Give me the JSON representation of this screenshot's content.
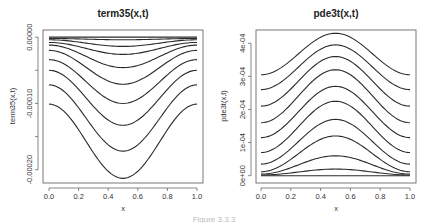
{
  "caption": "Figure 3.3.3",
  "chart_data": [
    {
      "type": "line",
      "title": "term35(x,t)",
      "xlabel": "x",
      "ylabel": "term35(x,t)",
      "xlim": [
        0,
        1
      ],
      "ylim": [
        -0.00022,
        1e-05
      ],
      "x_ticks": [
        "0.0",
        "0.2",
        "0.4",
        "0.6",
        "0.8",
        "1.0"
      ],
      "y_ticks": [
        "0.00000",
        "",
        "-0.00010",
        "",
        "-0.00020"
      ],
      "y_tick_values": [
        0.0,
        -5e-05,
        -0.0001,
        -0.00015,
        -0.0002
      ],
      "grid": false,
      "legend": null,
      "shape": "symmetric trough centered at x=0.5",
      "series": [
        {
          "name": "t1",
          "edge": 0.0,
          "extreme": 0.0
        },
        {
          "name": "t2",
          "edge": -2e-06,
          "extreme": -4e-06
        },
        {
          "name": "t3",
          "edge": -4e-06,
          "extreme": -1.4e-05
        },
        {
          "name": "t4",
          "edge": -8e-06,
          "extreme": -2.6e-05
        },
        {
          "name": "t5",
          "edge": -1.2e-05,
          "extreme": -4.6e-05
        },
        {
          "name": "t6",
          "edge": -2e-05,
          "extreme": -7.1e-05
        },
        {
          "name": "t7",
          "edge": -3.4e-05,
          "extreme": -0.0001
        },
        {
          "name": "t8",
          "edge": -5e-05,
          "extreme": -0.000133
        },
        {
          "name": "t9",
          "edge": -7.2e-05,
          "extreme": -0.000172
        },
        {
          "name": "t10",
          "edge": -0.000101,
          "extreme": -0.000213
        }
      ]
    },
    {
      "type": "line",
      "title": "pde3t(x,t)",
      "xlabel": "x",
      "ylabel": "pde3t(x,t)",
      "xlim": [
        0,
        1
      ],
      "ylim": [
        -1e-05,
        0.00044
      ],
      "x_ticks": [
        "0.0",
        "0.2",
        "0.4",
        "0.6",
        "0.8",
        "1.0"
      ],
      "y_ticks": [
        "0e+00",
        "1e-04",
        "2e-04",
        "3e-04",
        "4e-04"
      ],
      "y_tick_values": [
        0.0,
        0.0001,
        0.0002,
        0.0003,
        0.0004
      ],
      "grid": false,
      "legend": null,
      "shape": "symmetric bump centered at x=0.5",
      "series": [
        {
          "name": "t1",
          "edge": 0.0,
          "extreme": 0.0
        },
        {
          "name": "t2",
          "edge": 2e-06,
          "extreme": 2e-05
        },
        {
          "name": "t3",
          "edge": 5e-06,
          "extreme": 6e-05
        },
        {
          "name": "t4",
          "edge": 1.2e-05,
          "extreme": 0.00012
        },
        {
          "name": "t5",
          "edge": 3.5e-05,
          "extreme": 0.00017
        },
        {
          "name": "t6",
          "edge": 7e-05,
          "extreme": 0.000225
        },
        {
          "name": "t7",
          "edge": 0.000115,
          "extreme": 0.00027
        },
        {
          "name": "t8",
          "edge": 0.00016,
          "extreme": 0.00032
        },
        {
          "name": "t9",
          "edge": 0.00021,
          "extreme": 0.00036
        },
        {
          "name": "t10",
          "edge": 0.00026,
          "extreme": 0.000395
        },
        {
          "name": "t11",
          "edge": 0.000305,
          "extreme": 0.00043
        }
      ]
    }
  ]
}
